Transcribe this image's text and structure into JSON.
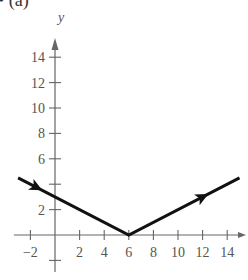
{
  "figure": {
    "part_label": "• (a)",
    "axis_y_label": "y"
  },
  "colors": {
    "axis": "#666666",
    "curve": "#111111",
    "text": "#555555"
  },
  "chart_data": {
    "type": "line",
    "title": "",
    "xlabel": "",
    "ylabel": "y",
    "xlim": [
      -3,
      15.5
    ],
    "ylim": [
      -3,
      15.5
    ],
    "x_ticks": [
      -2,
      2,
      4,
      6,
      8,
      10,
      12,
      14
    ],
    "y_ticks": [
      2,
      4,
      6,
      8,
      10,
      12,
      14
    ],
    "y_tick_labels_shown": [
      2,
      6,
      8,
      10,
      12,
      14
    ],
    "grid": false,
    "series": [
      {
        "name": "y = |x - 6| / 2",
        "x": [
          -3,
          6,
          15
        ],
        "y": [
          4.5,
          0,
          4.5
        ],
        "arrows": [
          {
            "at": [
              -1.5,
              3.75
            ],
            "direction": "toward vertex"
          },
          {
            "at": [
              12,
              3
            ],
            "direction": "away from vertex"
          }
        ]
      }
    ],
    "vertex": [
      6,
      0
    ]
  }
}
